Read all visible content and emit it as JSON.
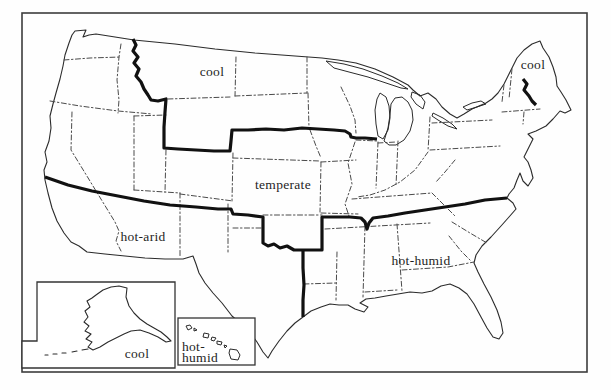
{
  "map": {
    "region_labels": {
      "cool_north": "cool",
      "cool_maine": "cool",
      "temperate": "temperate",
      "hot_arid": "hot-arid",
      "hot_humid": "hot-humid"
    },
    "insets": {
      "alaska": {
        "label": "cool"
      },
      "hawaii": {
        "label_line1": "hot-",
        "label_line2": "humid"
      }
    },
    "colors": {
      "frame": "#3d3d3d",
      "coast_outline": "#2b2b2b",
      "state_border_dash": "#4a4a4a",
      "climate_boundary": "#111111",
      "background": "#ffffff",
      "label_text": "#1f1f1f"
    }
  }
}
